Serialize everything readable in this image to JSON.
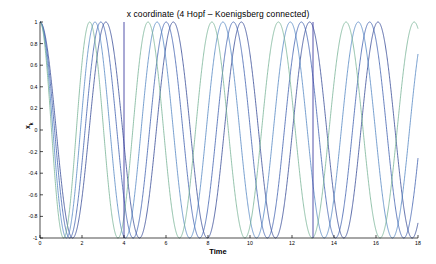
{
  "chart_data": {
    "type": "line",
    "title": "x coordinate (4 Hopf – Koenigsberg connected)",
    "xlabel": "Time",
    "ylabel": "x",
    "ylabel_sub": "k",
    "xlim": [
      0,
      18
    ],
    "ylim": [
      -1,
      1
    ],
    "grid": false,
    "legend": false,
    "xticks": [
      0,
      2,
      4,
      6,
      8,
      10,
      12,
      14,
      16,
      18
    ],
    "xticklabels": [
      "0",
      "2",
      "4",
      "6",
      "8",
      "10",
      "12",
      "14",
      "16",
      "18"
    ],
    "yticks": [
      -1,
      -0.8,
      -0.6,
      -0.4,
      -0.2,
      0,
      0.2,
      0.4,
      0.6,
      0.8,
      1
    ],
    "yticklabels": [
      "-1",
      "-0.8",
      "-0.6",
      "-0.4",
      "-0.2",
      "0",
      "0.2",
      "0.4",
      "0.6",
      "0.8",
      "1"
    ],
    "annotations": [
      {
        "name": "event-line-1",
        "x": 4.0,
        "type": "vertical-line",
        "color": "#4040a0"
      },
      {
        "name": "event-line-2",
        "x": 13.0,
        "type": "vertical-line",
        "color": "#4040a0"
      }
    ],
    "series": [
      {
        "name": "oscillator-1",
        "color": "#2a3f8f",
        "initial_value": 1.0,
        "omega_initial": 2.05,
        "omega_final": 1.93,
        "sync_time": 5.6,
        "phase_offset": 0.0
      },
      {
        "name": "oscillator-2",
        "color": "#3355aa",
        "initial_value": 1.0,
        "omega_initial": 2.3,
        "omega_final": 1.93,
        "sync_time": 5.8,
        "phase_offset": 0.0
      },
      {
        "name": "oscillator-3",
        "color": "#4a7fbf",
        "initial_value": 1.0,
        "omega_initial": 2.62,
        "omega_final": 1.93,
        "sync_time": 6.0,
        "phase_offset": 0.0
      },
      {
        "name": "oscillator-4",
        "color": "#6fae8f",
        "initial_value": 1.0,
        "omega_initial": 2.95,
        "omega_final": 1.93,
        "sync_time": 6.2,
        "phase_offset": 0.0
      }
    ],
    "synchronized_period": 3.25,
    "synchronized_peaks": [
      6.4,
      9.6,
      12.9,
      15.8
    ],
    "synchronized_troughs": [
      8.0,
      11.2,
      14.3,
      17.5
    ]
  }
}
